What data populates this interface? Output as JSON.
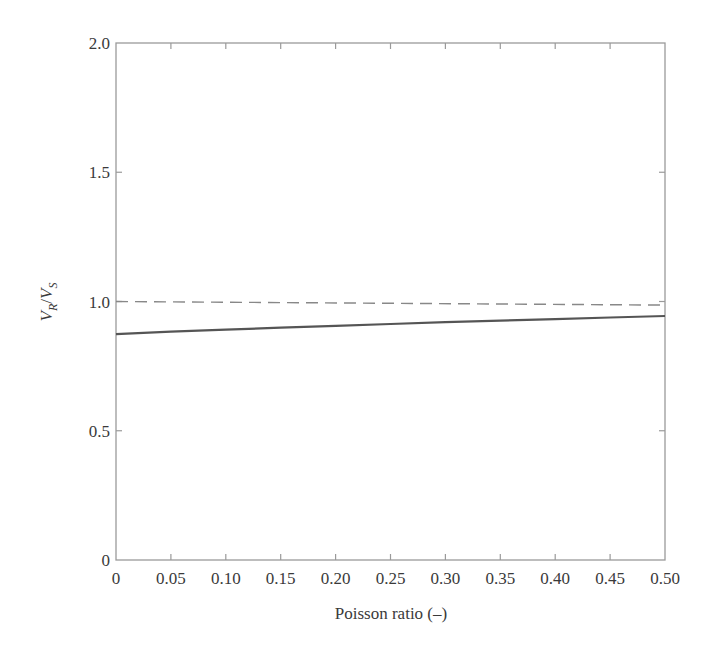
{
  "chart_data": {
    "type": "line",
    "title": "",
    "xlabel": "Poisson ratio (–)",
    "ylabel": "V_R/V_S",
    "ylabel_parts": {
      "v1": "V",
      "sub1": "R",
      "slash": "/",
      "v2": "V",
      "sub2": "S"
    },
    "xlim": [
      0,
      0.5
    ],
    "ylim": [
      0,
      2.0
    ],
    "xticks": [
      0,
      0.05,
      0.1,
      0.15,
      0.2,
      0.25,
      0.3,
      0.35,
      0.4,
      0.45,
      0.5
    ],
    "xtick_labels": [
      "0",
      "0.05",
      "0.10",
      "0.15",
      "0.20",
      "0.25",
      "0.30",
      "0.35",
      "0.40",
      "0.45",
      "0.50"
    ],
    "yticks": [
      0,
      0.5,
      1.0,
      1.5,
      2.0
    ],
    "ytick_labels": [
      "0",
      "0.5",
      "1.0",
      "1.5",
      "2.0"
    ],
    "grid": false,
    "legend": null,
    "series": [
      {
        "name": "V_R/V_S (solid)",
        "style": "solid",
        "color": "#555555",
        "x": [
          0,
          0.05,
          0.1,
          0.15,
          0.2,
          0.25,
          0.3,
          0.35,
          0.4,
          0.45,
          0.5
        ],
        "values": [
          0.874,
          0.883,
          0.891,
          0.899,
          0.906,
          0.913,
          0.92,
          0.926,
          0.932,
          0.938,
          0.944
        ]
      },
      {
        "name": "Reference (dashed)",
        "style": "dashed",
        "color": "#888888",
        "x": [
          0,
          0.5
        ],
        "values": [
          1.0,
          0.986
        ]
      }
    ]
  }
}
